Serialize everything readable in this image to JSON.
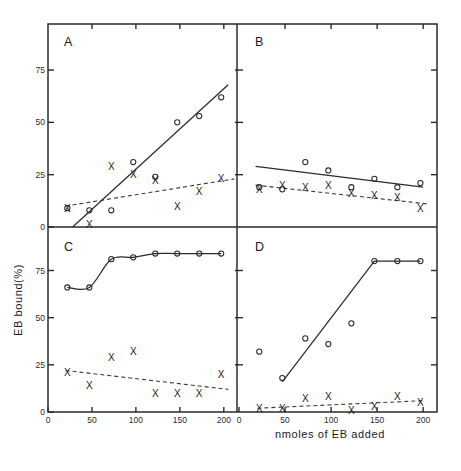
{
  "figure": {
    "xlabel": "nmoles of EB added",
    "ylabel": "EB bound(%)",
    "panel_letters": [
      "A",
      "B",
      "C",
      "D"
    ]
  },
  "axes": {
    "x_ticks": [
      0,
      50,
      100,
      150,
      200
    ],
    "x_ticklabels": [
      "0",
      "50",
      "100",
      "150",
      "200"
    ],
    "y_ticks": [
      0,
      25,
      50,
      75
    ],
    "y_ticklabels": [
      "0",
      "25",
      "50",
      "75"
    ],
    "xlim": [
      0,
      215
    ],
    "ylim": [
      0,
      97
    ]
  },
  "colors": {
    "ink": "#2b2b2b",
    "line_solid": "#2b2b2b",
    "line_dashed": "#3a3a3a",
    "background": "#ffffff"
  },
  "chart_data": [
    {
      "type": "scatter",
      "panel": "A",
      "title": "A",
      "xlabel": "nmoles of EB added",
      "ylabel": "EB bound(%)",
      "xlim": [
        0,
        215
      ],
      "ylim": [
        0,
        97
      ],
      "grid": false,
      "legend": "none",
      "series": [
        {
          "name": "open-circle",
          "marker": "circle",
          "x": [
            22,
            47,
            72,
            97,
            122,
            147,
            172,
            197
          ],
          "y": [
            9,
            8,
            8,
            31,
            24,
            50,
            53,
            62
          ]
        },
        {
          "name": "cross",
          "marker": "cross",
          "x": [
            22,
            47,
            72,
            97,
            122,
            147,
            172,
            197
          ],
          "y": [
            9,
            1,
            29,
            25,
            22,
            10,
            17,
            23
          ]
        }
      ],
      "fits": [
        {
          "name": "solid-fit",
          "style": "solid",
          "x": [
            28,
            205
          ],
          "y": [
            0,
            68
          ]
        },
        {
          "name": "dashed-fit",
          "style": "dashed",
          "x": [
            20,
            212
          ],
          "y": [
            10,
            23
          ]
        }
      ]
    },
    {
      "type": "scatter",
      "panel": "B",
      "title": "B",
      "xlabel": "nmoles of EB added",
      "ylabel": "EB bound(%)",
      "xlim": [
        0,
        215
      ],
      "ylim": [
        0,
        97
      ],
      "grid": false,
      "legend": "none",
      "series": [
        {
          "name": "open-circle",
          "marker": "circle",
          "x": [
            22,
            47,
            72,
            97,
            122,
            147,
            172,
            197
          ],
          "y": [
            19,
            18,
            31,
            27,
            19,
            23,
            19,
            21
          ]
        },
        {
          "name": "cross",
          "marker": "cross",
          "x": [
            22,
            47,
            72,
            97,
            122,
            147,
            172,
            197
          ],
          "y": [
            18,
            20,
            19,
            20,
            16,
            15,
            14,
            9
          ]
        }
      ],
      "fits": [
        {
          "name": "solid-fit",
          "style": "solid",
          "x": [
            18,
            200
          ],
          "y": [
            29,
            19
          ]
        },
        {
          "name": "dashed-fit",
          "style": "dashed",
          "x": [
            18,
            205
          ],
          "y": [
            20,
            11
          ]
        }
      ]
    },
    {
      "type": "scatter",
      "panel": "C",
      "title": "C",
      "xlabel": "nmoles of EB added",
      "ylabel": "EB bound(%)",
      "xlim": [
        0,
        215
      ],
      "ylim": [
        0,
        97
      ],
      "grid": false,
      "legend": "none",
      "series": [
        {
          "name": "open-circle",
          "marker": "circle",
          "x": [
            22,
            47,
            72,
            97,
            122,
            147,
            172,
            197
          ],
          "y": [
            66,
            66,
            81,
            82,
            84,
            84,
            84,
            84
          ]
        },
        {
          "name": "cross",
          "marker": "cross",
          "x": [
            22,
            47,
            72,
            97,
            122,
            147,
            172,
            197
          ],
          "y": [
            21,
            14,
            29,
            32,
            10,
            10,
            10,
            20
          ]
        }
      ],
      "fits": [
        {
          "name": "solid-curve",
          "style": "solid-curve",
          "x": [
            22,
            47,
            72,
            97,
            122,
            147,
            172,
            197
          ],
          "y": [
            66,
            66,
            81,
            82,
            84,
            84,
            84,
            84
          ]
        },
        {
          "name": "dashed-fit",
          "style": "dashed",
          "x": [
            20,
            205
          ],
          "y": [
            22,
            12
          ]
        }
      ]
    },
    {
      "type": "scatter",
      "panel": "D",
      "title": "D",
      "xlabel": "nmoles of EB added",
      "ylabel": "EB bound(%)",
      "xlim": [
        0,
        215
      ],
      "ylim": [
        0,
        97
      ],
      "grid": false,
      "legend": "none",
      "series": [
        {
          "name": "open-circle",
          "marker": "circle",
          "x": [
            22,
            47,
            72,
            97,
            122,
            147,
            172,
            197
          ],
          "y": [
            32,
            18,
            39,
            36,
            47,
            80,
            80,
            80
          ]
        },
        {
          "name": "cross",
          "marker": "cross",
          "x": [
            22,
            47,
            72,
            97,
            122,
            147,
            172,
            197
          ],
          "y": [
            2,
            2,
            7,
            8,
            1,
            3,
            8,
            5
          ]
        }
      ],
      "fits": [
        {
          "name": "solid-segments",
          "style": "solid-poly",
          "x": [
            47,
            147,
            172,
            197
          ],
          "y": [
            16,
            80,
            80,
            80
          ]
        },
        {
          "name": "dashed-fit",
          "style": "dashed",
          "x": [
            20,
            200
          ],
          "y": [
            2,
            6
          ]
        }
      ]
    }
  ]
}
